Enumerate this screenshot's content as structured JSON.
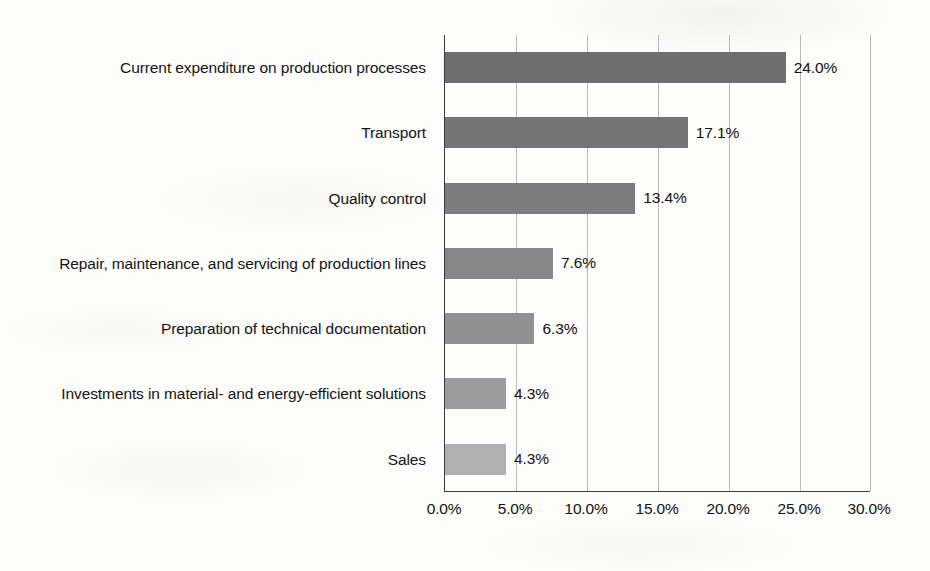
{
  "chart_data": {
    "type": "bar",
    "orientation": "horizontal",
    "title": "",
    "xlabel": "",
    "ylabel": "",
    "xlim": [
      0,
      30
    ],
    "xtick_labels": [
      "0.0%",
      "5.0%",
      "10.0%",
      "15.0%",
      "20.0%",
      "25.0%",
      "30.0%"
    ],
    "xtick_values": [
      0,
      5,
      10,
      15,
      20,
      25,
      30
    ],
    "grid": "vertical",
    "legend": "none",
    "categories": [
      "Current expenditure on production processes",
      "Transport",
      "Quality control",
      "Repair, maintenance, and servicing of production lines",
      "Preparation of technical documentation",
      "Investments in material- and energy-efficient solutions",
      "Sales"
    ],
    "values": [
      24.0,
      17.1,
      13.4,
      7.6,
      6.3,
      4.3,
      4.3
    ],
    "value_labels": [
      "24.0%",
      "17.1%",
      "13.4%",
      "7.6%",
      "6.3%",
      "4.3%",
      "4.3%"
    ],
    "bar_colors": [
      "#6e6e6e",
      "#757575",
      "#7d7d7d",
      "#868686",
      "#919191",
      "#9c9c9c",
      "#b0b0b0"
    ],
    "axis_color": "#3a3a3a",
    "gridline_color": "#b9b9b9",
    "background_color": "#fdfdfc"
  }
}
